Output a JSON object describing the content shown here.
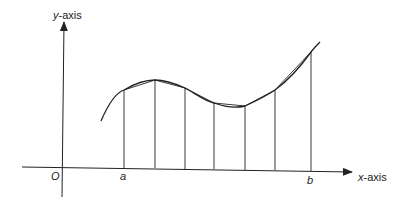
{
  "diagram": {
    "labels": {
      "y_axis": {
        "var": "y",
        "rest": "-axis"
      },
      "x_axis": {
        "var": "x",
        "rest": "-axis"
      },
      "origin": "O",
      "a": "a",
      "b": "b"
    },
    "colors": {
      "ink": "#222222",
      "background": "#ffffff"
    },
    "geometry": {
      "origin": [
        63,
        167
      ],
      "x_axis": {
        "from": [
          22,
          167
        ],
        "to": [
          352,
          172
        ]
      },
      "y_axis": {
        "from": [
          62,
          197
        ],
        "to": [
          64,
          22
        ]
      },
      "curve_path": "M101,121 C110,100 118,92 124,90 C134,84 146,80 155,80 C166,80 176,84 185,88 C196,94 205,101 214,103 C225,107 237,108 245,106 C256,101 266,96 275,90 C290,79 301,66 311,52 C314,48 317,45 320,42",
      "partition_points": [
        {
          "x": 124,
          "y_top": 90,
          "y_base": 168
        },
        {
          "x": 155,
          "y_top": 80,
          "y_base": 168
        },
        {
          "x": 185,
          "y_top": 88,
          "y_base": 169
        },
        {
          "x": 214,
          "y_top": 103,
          "y_base": 169
        },
        {
          "x": 245,
          "y_top": 106,
          "y_base": 170
        },
        {
          "x": 275,
          "y_top": 90,
          "y_base": 170
        },
        {
          "x": 311,
          "y_top": 52,
          "y_base": 171
        }
      ]
    }
  }
}
